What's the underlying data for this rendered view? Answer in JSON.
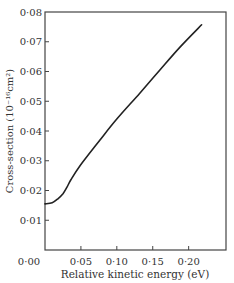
{
  "chart_data": {
    "type": "line",
    "title": "",
    "xlabel": "Relative kinetic energy (eV)",
    "ylabel": "Cross-section (10⁻¹⁶cm²)",
    "xlim": [
      0.0,
      0.252
    ],
    "ylim": [
      0.0,
      0.08
    ],
    "grid": false,
    "legend": null,
    "x_ticks": [
      0.05,
      0.1,
      0.15,
      0.2
    ],
    "x_tick_labels": [
      "0·05",
      "0·10",
      "0·15",
      "0·20"
    ],
    "y_ticks": [
      0.01,
      0.02,
      0.03,
      0.04,
      0.05,
      0.06,
      0.07,
      0.08
    ],
    "y_tick_labels": [
      "0·01",
      "0·02",
      "0·03",
      "0·04",
      "0·05",
      "0·06",
      "0·07",
      "0·08"
    ],
    "origin_label": "0·00",
    "series": [
      {
        "name": "Cross-section",
        "color": "#222222",
        "x": [
          0.0,
          0.01,
          0.018,
          0.025,
          0.031,
          0.036,
          0.049,
          0.076,
          0.1,
          0.132,
          0.16,
          0.188,
          0.218
        ],
        "y": [
          0.0155,
          0.0159,
          0.0172,
          0.0189,
          0.0213,
          0.0236,
          0.0284,
          0.0368,
          0.044,
          0.0527,
          0.0605,
          0.0682,
          0.0757
        ]
      }
    ]
  }
}
